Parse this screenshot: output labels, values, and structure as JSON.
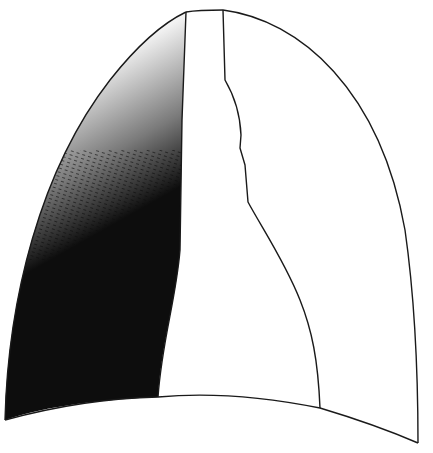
{
  "figure": {
    "type": "schematic line drawing",
    "width": 433,
    "height": 453,
    "colors": {
      "background": "#ffffff",
      "outline": "#1a1a1a",
      "opacity_fill": "#0d0d0d"
    },
    "regions": [
      {
        "name": "left-lung-field-opacity",
        "description": "dense dark shading in lower left zone fading upward with stippled gradient"
      },
      {
        "name": "mediastinum",
        "description": "central vertical band between two inner outlines"
      },
      {
        "name": "right-lung-field",
        "description": "clear unshaded right zone"
      },
      {
        "name": "diaphragm-dome",
        "description": "curved lower boundary"
      }
    ],
    "labels": []
  }
}
